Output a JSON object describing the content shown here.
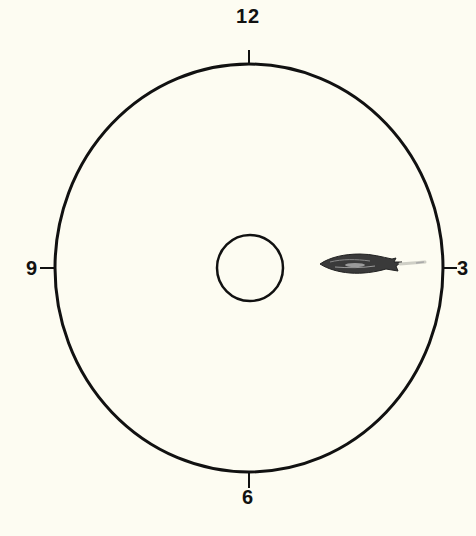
{
  "diagram": {
    "type": "clock-position tank diagram",
    "labels": {
      "top": "12",
      "right": "3",
      "bottom": "6",
      "left": "9"
    },
    "outer_ring": {
      "cx": 249,
      "cy": 268,
      "rx": 194,
      "ry": 204,
      "stroke": "#111111"
    },
    "inner_ring": {
      "cx": 250,
      "cy": 268,
      "r": 33,
      "stroke": "#111111"
    },
    "subject": {
      "name": "fish",
      "position": "3 o'clock, between center and rim",
      "heading": "toward 9 o'clock (head pointing left)"
    },
    "colors": {
      "background": "#fdfcf2",
      "ink": "#111111",
      "fish_dark": "#333333",
      "fish_mid": "#777777"
    }
  }
}
